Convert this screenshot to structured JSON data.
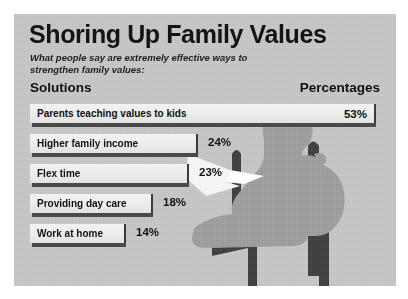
{
  "poster": {
    "title": "Shoring Up Family Values",
    "subtitle": "What people say are extremely effective ways to strengthen family values:",
    "background_color": "#c3c3c3",
    "bar_fill_color": "#ededeb",
    "bar_shadow_color": "#4a4a4a",
    "text_color": "#111111",
    "artwork": {
      "name": "silhouette-person-reading-in-chair",
      "silhouette_color": "#9a9a9a",
      "chair_color": "#3f3f3f",
      "paper_color": "#f4f4f2"
    }
  },
  "columns": {
    "solutions_header": "Solutions",
    "percentages_header": "Percentages"
  },
  "chart_data": {
    "type": "bar",
    "title": "Shoring Up Family Values",
    "subtitle": "What people say are extremely effective ways to strengthen family values:",
    "orientation": "horizontal",
    "xlabel": "Percentages",
    "ylabel": "Solutions",
    "xlim": [
      0,
      53
    ],
    "grid": false,
    "legend": false,
    "value_suffix": "%",
    "categories": [
      "Parents teaching values to kids",
      "Higher family income",
      "Flex time",
      "Providing day care",
      "Work at home"
    ],
    "values": [
      53,
      24,
      23,
      18,
      14
    ],
    "labels": [
      "53%",
      "24%",
      "23%",
      "18%",
      "14%"
    ],
    "bars": [
      {
        "category": "Parents teaching values to kids",
        "value": 53,
        "label": "53%",
        "width_px": 346,
        "label_inside": true
      },
      {
        "category": "Higher family income",
        "value": 24,
        "label": "24%",
        "width_px": 168,
        "label_inside": false
      },
      {
        "category": "Flex time",
        "value": 23,
        "label": "23%",
        "width_px": 159,
        "label_inside": false
      },
      {
        "category": "Providing day care",
        "value": 18,
        "label": "18%",
        "width_px": 123,
        "label_inside": false
      },
      {
        "category": "Work at home",
        "value": 14,
        "label": "14%",
        "width_px": 96,
        "label_inside": false
      }
    ]
  }
}
